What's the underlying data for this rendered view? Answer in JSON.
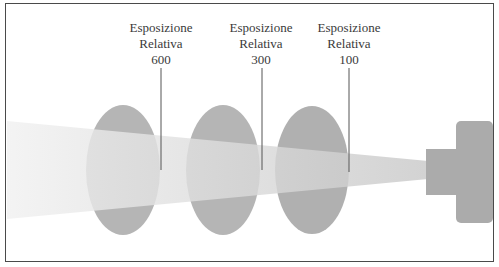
{
  "diagram": {
    "type": "light-beam-exposure",
    "labels": [
      {
        "line1": "Esposizione",
        "line2": "Relativa",
        "value": "600"
      },
      {
        "line1": "Esposizione",
        "line2": "Relativa",
        "value": "300"
      },
      {
        "line1": "Esposizione",
        "line2": "Relativa",
        "value": "100"
      }
    ],
    "colors": {
      "border": "#4a4a4a",
      "lens": "#b3b3b3",
      "beam": "#e4e4e4",
      "source": "#ababab",
      "text": "#3a3a3a",
      "pointer_line": "#555555"
    }
  }
}
